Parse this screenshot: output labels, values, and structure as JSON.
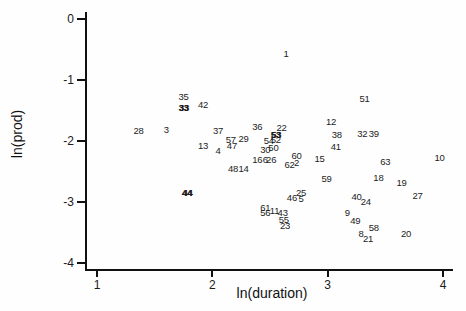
{
  "figure": {
    "background": "#fefefe",
    "axis_color": "#111111",
    "text_color": "#1c1c1c"
  },
  "chart_data": {
    "type": "scatter",
    "marker": "observation-number-labels",
    "title": "",
    "xlabel": "ln(duration)",
    "ylabel": "ln(prod)",
    "xlim": [
      0.9,
      4.08
    ],
    "ylim": [
      -4.15,
      0.1
    ],
    "x_ticks": [
      1,
      2,
      3,
      4
    ],
    "y_ticks": [
      0,
      -1,
      -2,
      -3,
      -4
    ],
    "grid": false,
    "legend": "none",
    "points": [
      {
        "label": "1",
        "x": 2.64,
        "y": -0.56,
        "bold": false
      },
      {
        "label": "35",
        "x": 1.75,
        "y": -1.26,
        "bold": false
      },
      {
        "label": "33",
        "x": 1.75,
        "y": -1.44,
        "bold": true
      },
      {
        "label": "42",
        "x": 1.92,
        "y": -1.39,
        "bold": false
      },
      {
        "label": "51",
        "x": 3.32,
        "y": -1.3,
        "bold": false
      },
      {
        "label": "12",
        "x": 3.03,
        "y": -1.67,
        "bold": false
      },
      {
        "label": "36",
        "x": 2.39,
        "y": -1.75,
        "bold": false
      },
      {
        "label": "22",
        "x": 2.6,
        "y": -1.77,
        "bold": false
      },
      {
        "label": "28",
        "x": 1.36,
        "y": -1.82,
        "bold": false
      },
      {
        "label": "3",
        "x": 1.6,
        "y": -1.8,
        "bold": false
      },
      {
        "label": "37",
        "x": 2.05,
        "y": -1.82,
        "bold": false
      },
      {
        "label": "38",
        "x": 3.08,
        "y": -1.89,
        "bold": false
      },
      {
        "label": "32",
        "x": 3.3,
        "y": -1.87,
        "bold": false
      },
      {
        "label": "39",
        "x": 3.4,
        "y": -1.87,
        "bold": false
      },
      {
        "label": "41",
        "x": 3.07,
        "y": -2.08,
        "bold": false
      },
      {
        "label": "57",
        "x": 2.16,
        "y": -1.97,
        "bold": false
      },
      {
        "label": "29",
        "x": 2.27,
        "y": -1.95,
        "bold": false
      },
      {
        "label": "47",
        "x": 2.17,
        "y": -2.07,
        "bold": false
      },
      {
        "label": "13",
        "x": 1.92,
        "y": -2.07,
        "bold": false
      },
      {
        "label": "4",
        "x": 2.05,
        "y": -2.15,
        "bold": false
      },
      {
        "label": "53",
        "x": 2.55,
        "y": -1.89,
        "bold": true
      },
      {
        "label": "54",
        "x": 2.49,
        "y": -1.98,
        "bold": false
      },
      {
        "label": "52",
        "x": 2.55,
        "y": -1.97,
        "bold": false
      },
      {
        "label": "30",
        "x": 2.46,
        "y": -2.13,
        "bold": false
      },
      {
        "label": "50",
        "x": 2.53,
        "y": -2.1,
        "bold": false
      },
      {
        "label": "16",
        "x": 2.39,
        "y": -2.3,
        "bold": false
      },
      {
        "label": "6",
        "x": 2.46,
        "y": -2.3,
        "bold": false
      },
      {
        "label": "26",
        "x": 2.51,
        "y": -2.3,
        "bold": false
      },
      {
        "label": "60",
        "x": 2.73,
        "y": -2.23,
        "bold": false
      },
      {
        "label": "2",
        "x": 2.73,
        "y": -2.34,
        "bold": false
      },
      {
        "label": "62",
        "x": 2.67,
        "y": -2.38,
        "bold": false
      },
      {
        "label": "48",
        "x": 2.18,
        "y": -2.44,
        "bold": false
      },
      {
        "label": "14",
        "x": 2.27,
        "y": -2.44,
        "bold": false
      },
      {
        "label": "15",
        "x": 2.93,
        "y": -2.28,
        "bold": false
      },
      {
        "label": "63",
        "x": 3.5,
        "y": -2.33,
        "bold": false
      },
      {
        "label": "10",
        "x": 3.97,
        "y": -2.26,
        "bold": false
      },
      {
        "label": "18",
        "x": 3.44,
        "y": -2.59,
        "bold": false
      },
      {
        "label": "19",
        "x": 3.64,
        "y": -2.67,
        "bold": false
      },
      {
        "label": "59",
        "x": 2.99,
        "y": -2.61,
        "bold": false
      },
      {
        "label": "44",
        "x": 1.78,
        "y": -2.84,
        "bold": true
      },
      {
        "label": "25",
        "x": 2.77,
        "y": -2.84,
        "bold": false
      },
      {
        "label": "46",
        "x": 2.69,
        "y": -2.92,
        "bold": false
      },
      {
        "label": "5",
        "x": 2.77,
        "y": -2.93,
        "bold": false
      },
      {
        "label": "27",
        "x": 3.78,
        "y": -2.89,
        "bold": false
      },
      {
        "label": "40",
        "x": 3.25,
        "y": -2.9,
        "bold": false
      },
      {
        "label": "24",
        "x": 3.33,
        "y": -2.98,
        "bold": false
      },
      {
        "label": "61",
        "x": 2.46,
        "y": -3.08,
        "bold": false
      },
      {
        "label": "56",
        "x": 2.46,
        "y": -3.16,
        "bold": false
      },
      {
        "label": "11",
        "x": 2.54,
        "y": -3.13,
        "bold": false
      },
      {
        "label": "43",
        "x": 2.61,
        "y": -3.16,
        "bold": false
      },
      {
        "label": "55",
        "x": 2.62,
        "y": -3.28,
        "bold": false
      },
      {
        "label": "23",
        "x": 2.63,
        "y": -3.38,
        "bold": false
      },
      {
        "label": "9",
        "x": 3.17,
        "y": -3.16,
        "bold": false
      },
      {
        "label": "49",
        "x": 3.24,
        "y": -3.3,
        "bold": false
      },
      {
        "label": "58",
        "x": 3.4,
        "y": -3.41,
        "bold": false
      },
      {
        "label": "8",
        "x": 3.29,
        "y": -3.51,
        "bold": false
      },
      {
        "label": "21",
        "x": 3.35,
        "y": -3.59,
        "bold": false
      },
      {
        "label": "20",
        "x": 3.68,
        "y": -3.51,
        "bold": false
      }
    ]
  }
}
